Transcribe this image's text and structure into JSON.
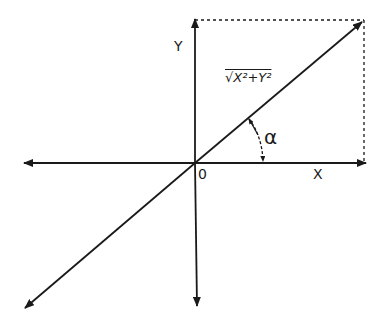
{
  "diagram": {
    "labels": {
      "y_axis": "Y",
      "x_axis": "X",
      "origin": "0",
      "hypotenuse": "√X²+Y²",
      "angle": "α"
    },
    "colors": {
      "line": "#1a1a1a",
      "background": "#ffffff"
    }
  }
}
